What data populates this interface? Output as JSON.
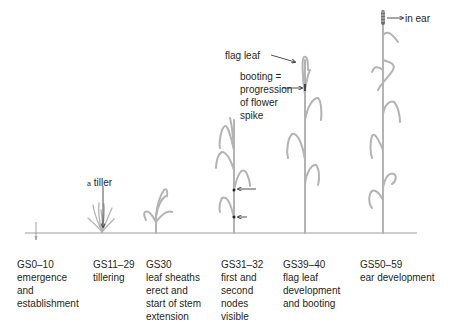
{
  "diagram": {
    "baseline_color": "#9d9d9d",
    "plant_color": "#b3b3b3",
    "text_color": "#231f20"
  },
  "stages": [
    {
      "code": "GS0–10",
      "lines": [
        "emergence",
        "and",
        "establishment"
      ]
    },
    {
      "code": "GS11–29",
      "lines": [
        "tillering"
      ]
    },
    {
      "code": "GS30",
      "lines": [
        "leaf sheaths",
        "erect and",
        "start of stem",
        "extension"
      ]
    },
    {
      "code": "GS31–32",
      "lines": [
        "first and",
        "second",
        "nodes",
        "visible"
      ]
    },
    {
      "code": "GS39–40",
      "lines": [
        "flag leaf",
        "development",
        "and booting"
      ]
    },
    {
      "code": "GS50–59",
      "lines": [
        "ear development"
      ]
    }
  ],
  "annotations": {
    "tiller_prefix": "a",
    "tiller": "tiller",
    "flag_leaf": "flag leaf",
    "booting": [
      "booting =",
      "progression",
      "of flower",
      "spike"
    ],
    "in_ear": "in ear"
  }
}
